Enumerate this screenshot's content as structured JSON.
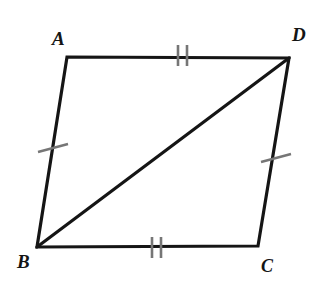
{
  "figure": {
    "type": "geometry-diagram",
    "shape": "quadrilateral",
    "background_color": "#ffffff",
    "stroke_color": "#151515",
    "tick_color": "#767676",
    "stroke_width": 3.2,
    "tick_width": 2.6,
    "vertices": [
      {
        "name": "A",
        "label": "A",
        "x": 67,
        "y": 57,
        "label_x": 52,
        "label_y": 29
      },
      {
        "name": "D",
        "label": "D",
        "x": 289,
        "y": 58,
        "label_x": 292,
        "label_y": 25
      },
      {
        "name": "B",
        "label": "B",
        "x": 37,
        "y": 247,
        "label_x": 17,
        "label_y": 252
      },
      {
        "name": "C",
        "label": "C",
        "x": 258,
        "y": 246,
        "label_x": 261,
        "label_y": 257
      }
    ],
    "edges": [
      {
        "name": "side-AD",
        "from": "A",
        "to": "D",
        "ticks": 2,
        "tick_orientation": "vertical"
      },
      {
        "name": "side-DC",
        "from": "D",
        "to": "C",
        "ticks": 1,
        "tick_orientation": "cross"
      },
      {
        "name": "side-CB",
        "from": "C",
        "to": "B",
        "ticks": 2,
        "tick_orientation": "vertical"
      },
      {
        "name": "side-BA",
        "from": "B",
        "to": "A",
        "ticks": 1,
        "tick_orientation": "cross"
      }
    ],
    "diagonal": {
      "name": "diagonal-BD",
      "from": "B",
      "to": "D"
    },
    "tick_marks": [
      {
        "name": "tick-AD-1",
        "edge": "AD",
        "x1": 178,
        "y1": 45,
        "x2": 178,
        "y2": 66
      },
      {
        "name": "tick-AD-2",
        "edge": "AD",
        "x1": 187,
        "y1": 45,
        "x2": 187,
        "y2": 66
      },
      {
        "name": "tick-BC-1",
        "edge": "BC",
        "x1": 152,
        "y1": 237,
        "x2": 152,
        "y2": 258
      },
      {
        "name": "tick-BC-2",
        "edge": "BC",
        "x1": 161,
        "y1": 237,
        "x2": 161,
        "y2": 258
      },
      {
        "name": "tick-AB-1",
        "edge": "AB",
        "x1": 38,
        "y1": 152,
        "x2": 68,
        "y2": 144
      },
      {
        "name": "tick-DC-1",
        "edge": "DC",
        "x1": 261,
        "y1": 162,
        "x2": 291,
        "y2": 154
      }
    ],
    "labels": {
      "A": "A",
      "B": "B",
      "C": "C",
      "D": "D"
    }
  }
}
